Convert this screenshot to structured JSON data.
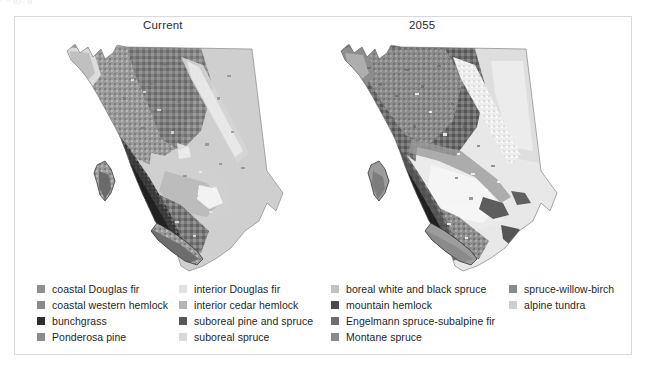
{
  "clipped_top_text": "r                                                                                                    k     gy,                 g",
  "figure": {
    "maps": [
      {
        "id": "current",
        "title": "Current",
        "region": "British Columbia",
        "description": "grayscale biogeoclimatic zone map of British Columbia, current climate"
      },
      {
        "id": "2055",
        "title": "2055",
        "region": "British Columbia",
        "description": "grayscale biogeoclimatic zone map of British Columbia, projected 2055 climate"
      }
    ]
  },
  "legend": {
    "columns": [
      {
        "items": [
          {
            "label": "coastal Douglas fir",
            "color": "#8e8e8e"
          },
          {
            "label": "coastal western hemlock",
            "color": "#8a8a8a"
          },
          {
            "label": "bunchgrass",
            "color": "#2f2f2f"
          },
          {
            "label": "Ponderosa pine",
            "color": "#8c8c8c"
          }
        ]
      },
      {
        "items": [
          {
            "label": "interior Douglas fir",
            "color": "#e2e2e2"
          },
          {
            "label": "interior cedar hemlock",
            "color": "#b5b5b5"
          },
          {
            "label": "suboreal pine and spruce",
            "color": "#565656"
          },
          {
            "label": "suboreal spruce",
            "color": "#d8d8d8"
          }
        ]
      },
      {
        "items": [
          {
            "label": "boreal white and black spruce",
            "color": "#c2c2c2"
          },
          {
            "label": "mountain hemlock",
            "color": "#4a4a4a"
          },
          {
            "label": "Engelmann spruce-subalpine fir",
            "color": "#6e6e6e"
          },
          {
            "label": "Montane spruce",
            "color": "#8a8a8a"
          }
        ]
      },
      {
        "items": [
          {
            "label": "spruce-willow-birch",
            "color": "#8a8a8a"
          },
          {
            "label": "alpine tundra",
            "color": "#cfcfcf"
          }
        ]
      }
    ]
  },
  "colors": {
    "frame_border": "#d9d9dd",
    "background": "#ffffff",
    "text": "#1f1f1f"
  }
}
